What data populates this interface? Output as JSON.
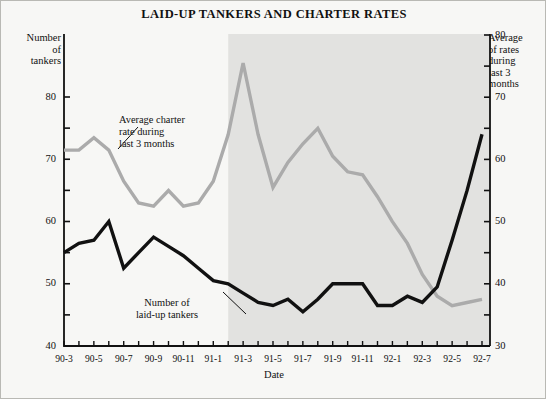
{
  "chart_data": {
    "type": "line",
    "title": "LAID-UP TANKERS AND CHARTER RATES",
    "xlabel": "Date",
    "ylabel": "Number of tankers",
    "y2label": "Average of rates during last 3 months",
    "grid": false,
    "legend_position": "inline-annotations",
    "ylim": [
      40,
      82
    ],
    "y2lim": [
      30,
      82
    ],
    "yticks": [
      40,
      45,
      50,
      55,
      60,
      65,
      70,
      75,
      80
    ],
    "ytick_labels": [
      "40",
      "",
      "50",
      "",
      "60",
      "",
      "70",
      "",
      "80"
    ],
    "y2ticks": [
      30,
      35,
      40,
      45,
      50,
      55,
      60,
      65,
      70,
      75,
      80
    ],
    "y2tick_labels": [
      "30",
      "",
      "40",
      "",
      "50",
      "",
      "60",
      "",
      "70",
      "",
      "80"
    ],
    "x": [
      "90-3",
      "90-4",
      "90-5",
      "90-6",
      "90-7",
      "90-8",
      "90-9",
      "90-10",
      "90-11",
      "90-12",
      "91-1",
      "91-2",
      "91-3",
      "91-4",
      "91-5",
      "91-6",
      "91-7",
      "91-8",
      "91-9",
      "91-10",
      "91-11",
      "91-12",
      "92-1",
      "92-2",
      "92-3",
      "92-4",
      "92-5",
      "92-6",
      "92-7"
    ],
    "xtick_labels": [
      "90-3",
      "90-5",
      "90-7",
      "90-9",
      "90-11",
      "91-1",
      "91-3",
      "91-5",
      "91-7",
      "91-9",
      "91-11",
      "92-1",
      "92-3",
      "92-5",
      "92-7"
    ],
    "series": [
      {
        "name": "Number of laid-up tankers",
        "axis": "left",
        "color": "#111111",
        "width": 3.4,
        "values": [
          55,
          56.5,
          57,
          60,
          52.5,
          55,
          57.5,
          56,
          54.5,
          52.5,
          50.5,
          50,
          48.5,
          47,
          46.5,
          47.5,
          45.5,
          47.5,
          50,
          50,
          50,
          46.5,
          46.5,
          48,
          47,
          49.5,
          57,
          65,
          74
        ]
      },
      {
        "name": "Average charter rate during last 3 months",
        "axis": "right",
        "color": "#ababab",
        "width": 3.4,
        "values": [
          61.5,
          61.5,
          63.5,
          61.5,
          56.5,
          53,
          52.5,
          55,
          52.5,
          53,
          56.5,
          64,
          75.5,
          64,
          55.5,
          59.5,
          62.5,
          65,
          60.5,
          58,
          57.5,
          54,
          50,
          46.5,
          41.5,
          38,
          36.5,
          37,
          37.5
        ]
      }
    ],
    "shaded_region": {
      "from": "91-2",
      "to": "92-7",
      "color": "#e2e2e0"
    },
    "annotations": [
      {
        "text_lines": [
          "Average charter",
          "rate during",
          "last 3 months"
        ],
        "name": "charter-rate-annotation"
      },
      {
        "text_lines": [
          "Number of",
          "laid-up tankers"
        ],
        "name": "laid-up-tankers-annotation"
      }
    ]
  },
  "axis_captions": {
    "left": "Number\nof\ntankers",
    "right": "Average\nof rates\nduring\nlast 3\nmonths"
  }
}
